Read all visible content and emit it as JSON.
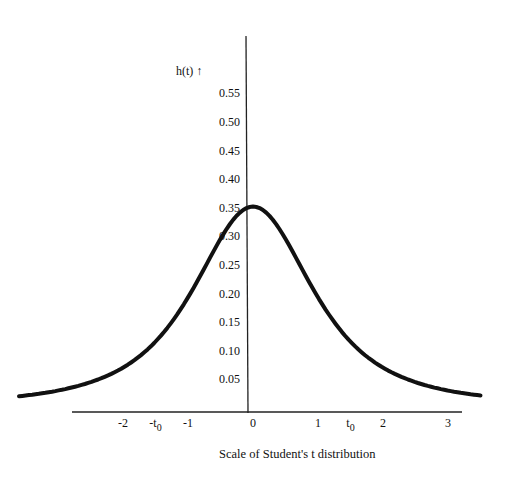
{
  "chart_data": {
    "type": "line",
    "title": "",
    "xlabel": "Scale of Student's t distribution",
    "ylabel": "h(t) ↑",
    "xlim": [
      -3.6,
      3.5
    ],
    "ylim": [
      0,
      0.6
    ],
    "grid": false,
    "legend": "none",
    "y_ticks": [
      "0.05",
      "0.10",
      "0.15",
      "0.20",
      "0.25",
      "0.30",
      "0.35",
      "0.40",
      "0.45",
      "0.50",
      "0.55"
    ],
    "y_tick_values": [
      0.05,
      0.1,
      0.15,
      0.2,
      0.25,
      0.3,
      0.35,
      0.4,
      0.45,
      0.5,
      0.55
    ],
    "x_ticks": [
      {
        "label": "-2",
        "value": -2
      },
      {
        "label": "-t",
        "sub": "0",
        "value": -1.5
      },
      {
        "label": "-1",
        "value": -1
      },
      {
        "label": "0",
        "value": 0
      },
      {
        "label": "1",
        "value": 1
      },
      {
        "label": "t",
        "sub": "0",
        "value": 1.5
      },
      {
        "label": "2",
        "value": 2
      },
      {
        "label": "3",
        "value": 3
      }
    ],
    "series": [
      {
        "name": "h(t)",
        "x": [
          -3.6,
          -3.2,
          -2.8,
          -2.4,
          -2.0,
          -1.6,
          -1.2,
          -0.8,
          -0.4,
          0.0,
          0.4,
          0.8,
          1.2,
          1.6,
          2.0,
          2.4,
          2.8,
          3.2,
          3.5
        ],
        "y": [
          0.02,
          0.027,
          0.037,
          0.052,
          0.068,
          0.095,
          0.15,
          0.22,
          0.3,
          0.35,
          0.3,
          0.22,
          0.15,
          0.095,
          0.068,
          0.052,
          0.037,
          0.027,
          0.022
        ]
      }
    ]
  }
}
